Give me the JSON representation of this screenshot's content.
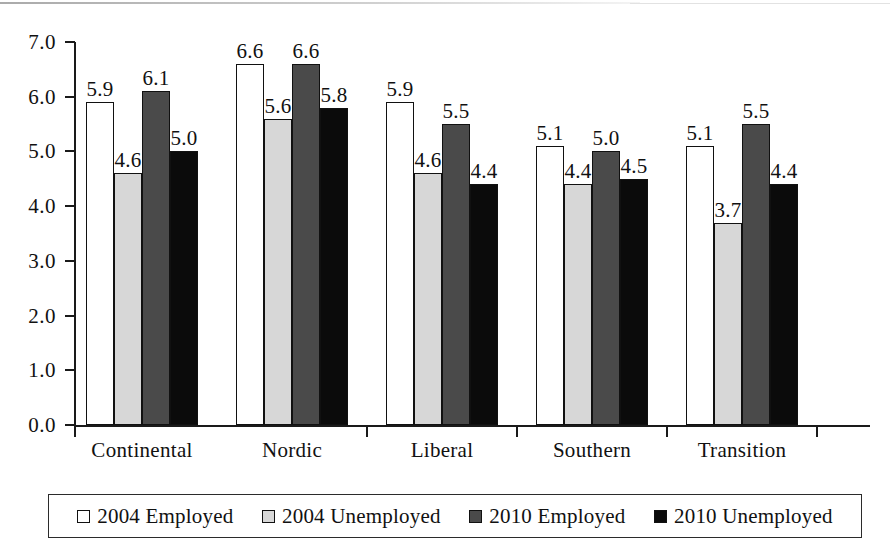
{
  "chart_data": {
    "type": "bar",
    "title": "",
    "xlabel": "",
    "ylabel": "",
    "ylim": [
      0.0,
      7.0
    ],
    "ytick_labels": [
      "0.0",
      "1.0",
      "2.0",
      "3.0",
      "4.0",
      "5.0",
      "6.0",
      "7.0"
    ],
    "ytick_values": [
      0.0,
      1.0,
      2.0,
      3.0,
      4.0,
      5.0,
      6.0,
      7.0
    ],
    "grid": false,
    "legend_position": "bottom",
    "categories": [
      "Continental",
      "Nordic",
      "Liberal",
      "Southern",
      "Transition"
    ],
    "series": [
      {
        "name": "2004 Employed",
        "color": "#ffffff",
        "values": [
          5.9,
          6.6,
          5.9,
          5.1,
          5.1
        ],
        "labels": [
          "5.9",
          "6.6",
          "5.9",
          "5.1",
          "5.1"
        ]
      },
      {
        "name": "2004 Unemployed",
        "color": "#d7d7d7",
        "values": [
          4.6,
          5.6,
          4.6,
          4.4,
          3.7
        ],
        "labels": [
          "4.6",
          "5.6",
          "4.6",
          "4.4",
          "3.7"
        ]
      },
      {
        "name": "2010 Employed",
        "color": "#4a4a4a",
        "values": [
          6.1,
          6.6,
          5.5,
          5.0,
          5.5
        ],
        "labels": [
          "6.1",
          "6.6",
          "5.5",
          "5.0",
          "5.5"
        ]
      },
      {
        "name": "2010 Unemployed",
        "color": "#0b0b0b",
        "values": [
          5.0,
          5.8,
          4.4,
          4.5,
          4.4
        ],
        "labels": [
          "5.0",
          "5.8",
          "4.4",
          "4.5",
          "4.4"
        ]
      }
    ]
  },
  "legend": {
    "items": [
      {
        "label": "2004 Employed",
        "swatch": "white-square-swatch"
      },
      {
        "label": "2004 Unemployed",
        "swatch": "light-gray-square-swatch"
      },
      {
        "label": "2010 Employed",
        "swatch": "dark-gray-square-swatch"
      },
      {
        "label": "2010 Unemployed",
        "swatch": "black-square-swatch"
      }
    ]
  }
}
